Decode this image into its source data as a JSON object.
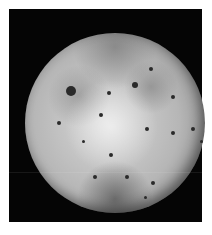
{
  "image": {
    "subject": "Grayscale photograph of a cratered, volcanic moon (Io-like) on a black background",
    "background_color": "#050505",
    "page_color": "#ffffff"
  },
  "spots": [
    {
      "x": 46,
      "y": 58,
      "r": 5
    },
    {
      "x": 34,
      "y": 90,
      "r": 2
    },
    {
      "x": 84,
      "y": 60,
      "r": 2
    },
    {
      "x": 76,
      "y": 82,
      "r": 2
    },
    {
      "x": 110,
      "y": 52,
      "r": 3
    },
    {
      "x": 126,
      "y": 36,
      "r": 2
    },
    {
      "x": 148,
      "y": 64,
      "r": 2
    },
    {
      "x": 168,
      "y": 96,
      "r": 2
    },
    {
      "x": 148,
      "y": 100,
      "r": 2
    },
    {
      "x": 86,
      "y": 122,
      "r": 2
    },
    {
      "x": 102,
      "y": 144,
      "r": 2
    },
    {
      "x": 128,
      "y": 150,
      "r": 2
    },
    {
      "x": 70,
      "y": 144,
      "r": 2
    },
    {
      "x": 122,
      "y": 96,
      "r": 2
    },
    {
      "x": 176,
      "y": 108,
      "r": 1.5
    },
    {
      "x": 58,
      "y": 108,
      "r": 1.5
    },
    {
      "x": 120,
      "y": 164,
      "r": 1.5
    }
  ]
}
